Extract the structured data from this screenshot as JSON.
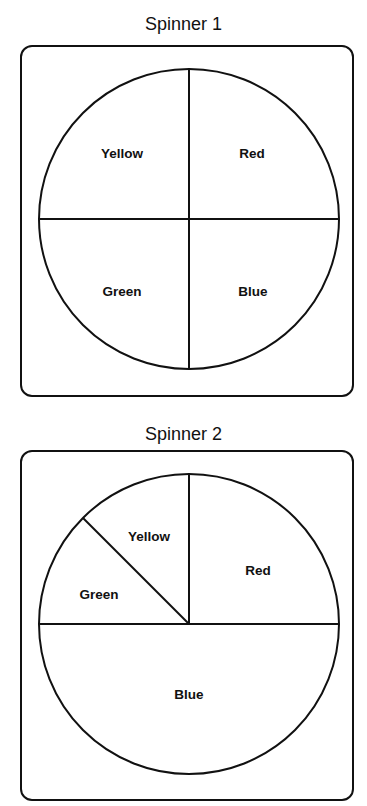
{
  "spinners": [
    {
      "title": "Spinner 1",
      "sections": [
        {
          "label": "Yellow",
          "fraction": "1/4"
        },
        {
          "label": "Red",
          "fraction": "1/4"
        },
        {
          "label": "Green",
          "fraction": "1/4"
        },
        {
          "label": "Blue",
          "fraction": "1/4"
        }
      ]
    },
    {
      "title": "Spinner 2",
      "sections": [
        {
          "label": "Yellow",
          "fraction": "1/8"
        },
        {
          "label": "Red",
          "fraction": "1/4"
        },
        {
          "label": "Green",
          "fraction": "1/8"
        },
        {
          "label": "Blue",
          "fraction": "1/2"
        }
      ]
    }
  ],
  "colors": {
    "stroke": "#111111",
    "background": "#ffffff"
  }
}
